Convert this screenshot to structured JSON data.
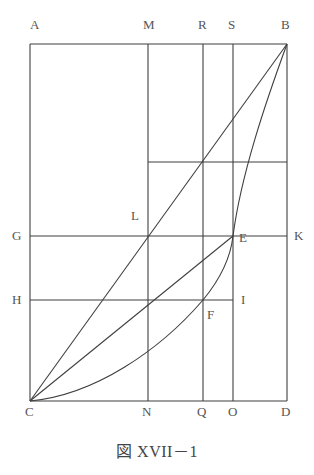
{
  "figure": {
    "caption": "図 XVII－1",
    "caption_parts": {
      "prefix": "図",
      "numeral": "XVII",
      "dash": "－",
      "index": "1"
    },
    "stroke_color": "#3f3f3f",
    "label_color": "#555555",
    "background_color": "#ffffff",
    "width": 314,
    "height": 475
  },
  "labels": [
    {
      "id": "A",
      "text": "A",
      "x": 30,
      "y": 18,
      "anchor": "left-above"
    },
    {
      "id": "M",
      "text": "M",
      "x": 143,
      "y": 18,
      "anchor": "above"
    },
    {
      "id": "R",
      "text": "R",
      "x": 198,
      "y": 18,
      "anchor": "above"
    },
    {
      "id": "S",
      "text": "S",
      "x": 228,
      "y": 18,
      "anchor": "above"
    },
    {
      "id": "B",
      "text": "B",
      "x": 281,
      "y": 18,
      "anchor": "above"
    },
    {
      "id": "G",
      "text": "G",
      "x": 12,
      "y": 229,
      "anchor": "left"
    },
    {
      "id": "L",
      "text": "L",
      "x": 131,
      "y": 209,
      "anchor": "left-above"
    },
    {
      "id": "E",
      "text": "E",
      "x": 239,
      "y": 231,
      "anchor": "right"
    },
    {
      "id": "K",
      "text": "K",
      "x": 294,
      "y": 229,
      "anchor": "right"
    },
    {
      "id": "H",
      "text": "H",
      "x": 12,
      "y": 293,
      "anchor": "left"
    },
    {
      "id": "F",
      "text": "F",
      "x": 207,
      "y": 308,
      "anchor": "right-below"
    },
    {
      "id": "I",
      "text": "I",
      "x": 241,
      "y": 293,
      "anchor": "right"
    },
    {
      "id": "C",
      "text": "C",
      "x": 25,
      "y": 405,
      "anchor": "below"
    },
    {
      "id": "N",
      "text": "N",
      "x": 142,
      "y": 405,
      "anchor": "below"
    },
    {
      "id": "Q",
      "text": "Q",
      "x": 197,
      "y": 405,
      "anchor": "below"
    },
    {
      "id": "O",
      "text": "O",
      "x": 228,
      "y": 405,
      "anchor": "below"
    },
    {
      "id": "D",
      "text": "D",
      "x": 281,
      "y": 405,
      "anchor": "below"
    }
  ],
  "points": {
    "A": [
      30,
      44
    ],
    "B": [
      287,
      44
    ],
    "C": [
      30,
      401
    ],
    "D": [
      287,
      401
    ],
    "M": [
      148,
      44
    ],
    "R": [
      203,
      44
    ],
    "S": [
      233,
      44
    ],
    "N": [
      148,
      401
    ],
    "Q": [
      203,
      401
    ],
    "O": [
      233,
      401
    ],
    "G": [
      30,
      236
    ],
    "K": [
      287,
      236
    ],
    "H": [
      30,
      300
    ],
    "I": [
      233,
      300
    ],
    "L": [
      148,
      236
    ],
    "E": [
      233,
      236
    ],
    "F": [
      203,
      300
    ]
  },
  "segments": [
    {
      "name": "outer-rect-top-AB",
      "from": "A",
      "to": "B"
    },
    {
      "name": "outer-rect-right-BD",
      "from": "B",
      "to": "D"
    },
    {
      "name": "outer-rect-bottom-CD",
      "from": "C",
      "to": "D"
    },
    {
      "name": "outer-rect-left-AC",
      "from": "A",
      "to": "C"
    },
    {
      "name": "vertical-MN",
      "from": "M",
      "to": "N"
    },
    {
      "name": "vertical-RQ",
      "from": "R",
      "to": "Q"
    },
    {
      "name": "vertical-SO",
      "from": "S",
      "to": "O"
    },
    {
      "name": "horizontal-GK",
      "from": "G",
      "to": "K"
    },
    {
      "name": "horizontal-HI",
      "from": "H",
      "to": "I"
    },
    {
      "name": "horizontal-mid-MB",
      "from": [
        148,
        162
      ],
      "to": [
        287,
        162
      ]
    },
    {
      "name": "diagonal-CB",
      "from": "C",
      "to": "B"
    },
    {
      "name": "diagonal-CE",
      "from": "C",
      "to": "E"
    }
  ],
  "curve": {
    "name": "parabolic-arc-CFEB",
    "through": [
      "C",
      "F",
      "E",
      "B"
    ],
    "path": "M 30 401 Q 130 388 203 300 Q 233 262 233 236 Q 262 158 287 44"
  }
}
